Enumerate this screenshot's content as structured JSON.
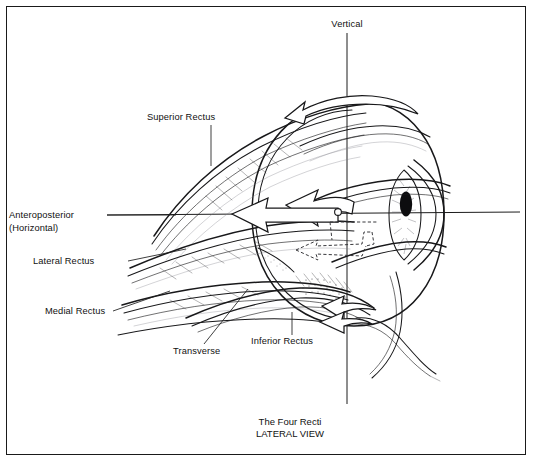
{
  "figure": {
    "title_line1": "The Four Recti",
    "title_line2": "LATERAL VIEW",
    "frame_color": "#1a1a1a",
    "ink_color": "#18181a",
    "background": "#ffffff"
  },
  "labels": {
    "vertical": "Vertical",
    "superior_rectus": "Superior Rectus",
    "anteroposterior": "Anteroposterior",
    "horizontal": "(Horizontal)",
    "lateral_rectus": "Lateral Rectus",
    "medial_rectus": "Medial Rectus",
    "transverse": "Transverse",
    "inferior_rectus": "Inferior Rectus"
  },
  "axes": [
    {
      "name": "vertical",
      "label": "Vertical",
      "orientation": "vertical"
    },
    {
      "name": "anteroposterior",
      "label": "Anteroposterior (Horizontal)",
      "orientation": "horizontal"
    },
    {
      "name": "transverse",
      "label": "Transverse",
      "orientation": "oblique"
    }
  ],
  "muscles": [
    {
      "name": "superior-rectus",
      "label": "Superior Rectus"
    },
    {
      "name": "lateral-rectus",
      "label": "Lateral Rectus"
    },
    {
      "name": "medial-rectus",
      "label": "Medial Rectus"
    },
    {
      "name": "inferior-rectus",
      "label": "Inferior Rectus"
    }
  ],
  "rotation_arrows": [
    {
      "name": "vertical-axis-rotation",
      "style": "solid-outline",
      "position": "top"
    },
    {
      "name": "anteroposterior-axis-rotation",
      "style": "solid-outline",
      "position": "middle-left"
    },
    {
      "name": "transverse-axis-rotation",
      "style": "dashed",
      "position": "middle-center"
    },
    {
      "name": "inferior-rotation",
      "style": "solid-outline",
      "position": "bottom"
    }
  ]
}
